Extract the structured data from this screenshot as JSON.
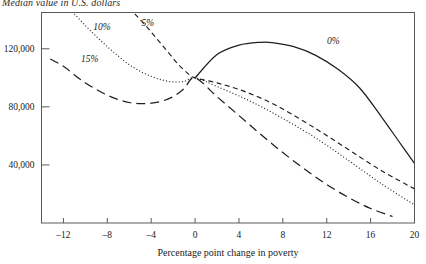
{
  "chart_data": {
    "type": "line",
    "title": "",
    "ylabel": "Median value in U.S. dollars",
    "xlabel": "Percentage point change in poverty",
    "xlim": [
      -14,
      20
    ],
    "ylim": [
      0,
      145000
    ],
    "xticks": [
      -12,
      -8,
      -4,
      0,
      4,
      8,
      12,
      16,
      20
    ],
    "xtick_labels": [
      "–12",
      "–8",
      "–4",
      "0",
      "4",
      "8",
      "12",
      "16",
      "20"
    ],
    "yticks": [
      40000,
      80000,
      120000
    ],
    "ytick_labels": [
      "40,000",
      "80,000",
      "120,000"
    ],
    "grid": false,
    "legend_position": "inline-annotations",
    "convergence_point": {
      "x": 0,
      "y": 100000
    },
    "series": [
      {
        "name": "0%",
        "label": "0%",
        "dash": "none",
        "label_x": 12.6,
        "label_y": 123000,
        "x": [
          0,
          2,
          4,
          6,
          7,
          9,
          11,
          13,
          15,
          17,
          18.5,
          20
        ],
        "values": [
          100000,
          116000,
          122500,
          124500,
          124300,
          121500,
          115500,
          106000,
          93000,
          73000,
          57000,
          41000
        ]
      },
      {
        "name": "5%",
        "label": "5%",
        "dash": "dash",
        "label_x": -4.3,
        "label_y": 136000,
        "x": [
          -5.5,
          -4.5,
          -3.5,
          -2.5,
          -1.5,
          -0.5,
          0,
          2,
          4,
          6,
          8,
          11,
          14,
          17,
          20
        ],
        "values": [
          144000,
          136000,
          127000,
          118000,
          109000,
          102000,
          100000,
          96500,
          92000,
          86000,
          78500,
          65000,
          50500,
          36000,
          23500
        ]
      },
      {
        "name": "10%",
        "label": "10%",
        "dash": "dot",
        "label_x": -8.5,
        "label_y": 133000,
        "x": [
          -11,
          -10,
          -9,
          -8,
          -7,
          -6,
          -5,
          -4,
          -3,
          -2,
          -1,
          0,
          2,
          5,
          8,
          11,
          14,
          17,
          20
        ],
        "values": [
          144000,
          136000,
          128500,
          121500,
          115000,
          109000,
          104500,
          101000,
          98500,
          97200,
          97500,
          100000,
          94000,
          84000,
          72000,
          58500,
          43000,
          27000,
          12500
        ]
      },
      {
        "name": "15%",
        "label": "15%",
        "dash": "longdash",
        "label_x": -9.6,
        "label_y": 111000,
        "x": [
          -13.2,
          -12,
          -11,
          -10,
          -9,
          -8,
          -7,
          -6,
          -5,
          -4,
          -3,
          -2,
          -1,
          0,
          2,
          4,
          6,
          8,
          10,
          12,
          14,
          16,
          18
        ],
        "values": [
          113000,
          108000,
          102000,
          96500,
          92000,
          88000,
          85000,
          83000,
          82200,
          82500,
          84000,
          87000,
          92500,
          100000,
          87000,
          74000,
          61000,
          48500,
          37000,
          26500,
          17500,
          10000,
          4500
        ]
      }
    ]
  },
  "colors": {
    "curve": "#1f1f1f",
    "frame": "#5a5a5a",
    "text": "#1a1a1a"
  }
}
